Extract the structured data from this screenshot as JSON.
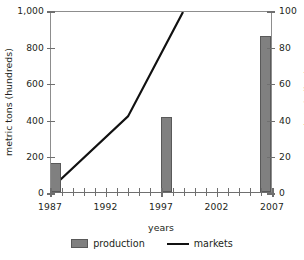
{
  "chart_data": {
    "type": "bar",
    "title": "",
    "xlabel": "years",
    "ylabel": "metric tons (hundreds)",
    "y2label": "markets in Ibadan",
    "xlim": [
      1987,
      2007
    ],
    "ylim": [
      0,
      1000
    ],
    "y2lim": [
      0,
      100
    ],
    "grid": false,
    "legend_position": "bottom",
    "x_ticks": [
      1987,
      1988,
      1989,
      1990,
      1991,
      1992,
      1993,
      1994,
      1995,
      1996,
      1997,
      1998,
      1999,
      2000,
      2001,
      2002,
      2003,
      2004,
      2005,
      2006,
      2007
    ],
    "x_tick_labels": [
      "1987",
      "1992",
      "1997",
      "2002",
      "2007"
    ],
    "x_tick_label_values": [
      1987,
      1992,
      1997,
      2002,
      2007
    ],
    "y_tick_labels": [
      "0",
      "200",
      "400",
      "600",
      "800",
      "1,000"
    ],
    "y_tick_values": [
      0,
      200,
      400,
      600,
      800,
      1000
    ],
    "y2_tick_labels": [
      "0",
      "20",
      "40",
      "60",
      "80",
      "100"
    ],
    "y2_tick_values": [
      0,
      20,
      40,
      60,
      80,
      100
    ],
    "series": [
      {
        "name": "production",
        "type": "bar",
        "axis": "left",
        "color": "#808080",
        "x": [
          1987,
          1997,
          2006
        ],
        "values": [
          160,
          410,
          855
        ]
      },
      {
        "name": "markets",
        "type": "line",
        "axis": "right",
        "color": "#111111",
        "x": [
          1987,
          1994,
          1999
        ],
        "values": [
          2,
          42,
          100
        ]
      }
    ]
  },
  "legend": {
    "items": [
      {
        "label": "production",
        "marker": "bar-swatch"
      },
      {
        "label": "markets",
        "marker": "line-swatch"
      }
    ]
  },
  "axes": {
    "x_title": "years",
    "y_title": "metric tons (hundreds)",
    "y2_title": "markets in Ibadan"
  }
}
